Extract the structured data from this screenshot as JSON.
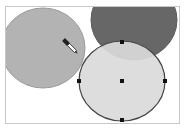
{
  "canvas": {
    "background": "#ffffff",
    "border_color": "#c8c8c8"
  },
  "shapes": [
    {
      "name": "left-circle",
      "cx": 43,
      "cy": 48,
      "rx": 42,
      "ry": 40,
      "fill": "#b3b3b3",
      "stroke": "#9a9a9a"
    },
    {
      "name": "dark-circle",
      "cx": 134,
      "cy": 20,
      "rx": 43,
      "ry": 40,
      "fill": "#676767",
      "stroke": "#5a5a5a"
    },
    {
      "name": "selected-circle",
      "cx": 122,
      "cy": 81,
      "rx": 43,
      "ry": 40,
      "fill": "#dadada",
      "stroke": "#444444",
      "selected": true
    }
  ],
  "selection_handles": [
    {
      "name": "handle-top",
      "x": 122,
      "y": 42
    },
    {
      "name": "handle-left",
      "x": 79,
      "y": 81
    },
    {
      "name": "handle-right",
      "x": 165,
      "y": 81
    },
    {
      "name": "handle-bottom",
      "x": 122,
      "y": 120
    },
    {
      "name": "handle-center",
      "x": 122,
      "y": 81
    }
  ],
  "cursor": {
    "icon": "eyedropper-icon",
    "x": 72,
    "y": 48
  }
}
